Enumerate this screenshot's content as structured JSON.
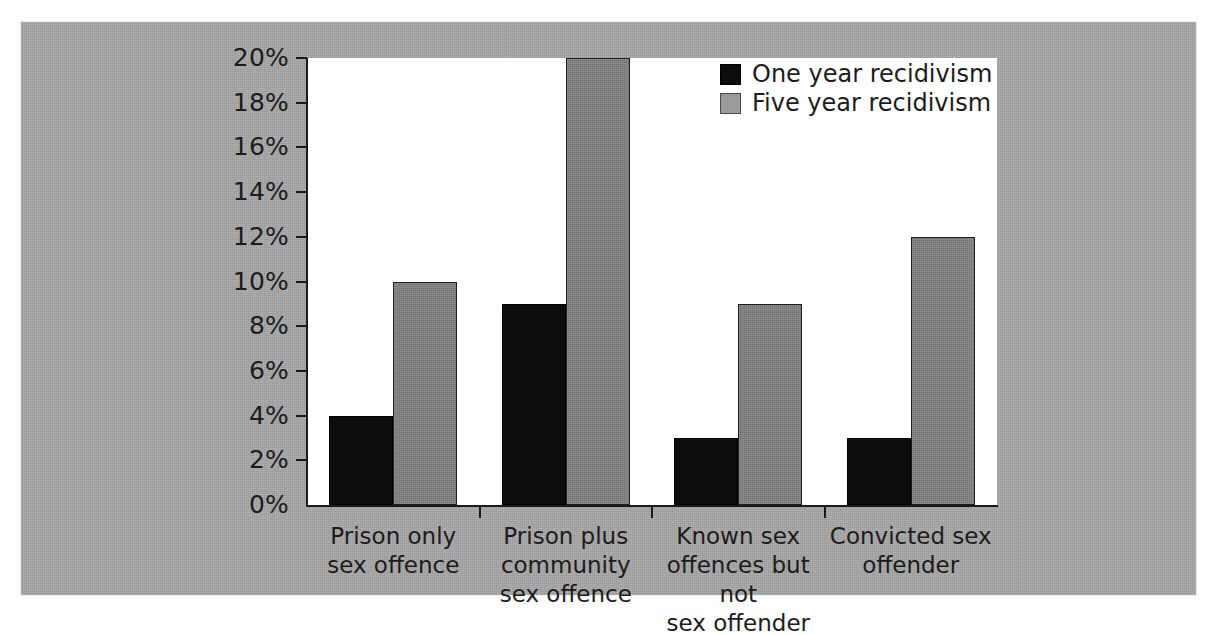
{
  "chart_data": {
    "type": "bar",
    "title": "",
    "subtitle": "",
    "xlabel": "",
    "ylabel": "",
    "ylim": [
      0,
      20
    ],
    "ytick_values": [
      0,
      2,
      4,
      6,
      8,
      10,
      12,
      14,
      16,
      18,
      20
    ],
    "ytick_labels": [
      "0%",
      "2%",
      "4%",
      "6%",
      "8%",
      "10%",
      "12%",
      "14%",
      "16%",
      "18%",
      "20%"
    ],
    "grid": false,
    "legend_position": "top-right",
    "value_suffix": "%",
    "categories": [
      "Prison only sex offence",
      "Prison plus community sex offence",
      "Known sex offences but not sex offender",
      "Convicted sex offender"
    ],
    "category_lines": [
      [
        "Prison only",
        "sex offence"
      ],
      [
        "Prison plus",
        "community",
        "sex offence"
      ],
      [
        "Known sex",
        "offences but not",
        "sex offender"
      ],
      [
        "Convicted sex",
        "offender"
      ]
    ],
    "series": [
      {
        "name": "One year recidivism",
        "color": "#0d0d0d",
        "values": [
          4,
          9,
          3,
          3
        ]
      },
      {
        "name": "Five year recidivism",
        "color": "#818181",
        "values": [
          10,
          20,
          9,
          12
        ]
      }
    ]
  },
  "legend": {
    "items": [
      {
        "label": "One year recidivism",
        "swatch": "black-square-swatch"
      },
      {
        "label": "Five year recidivism",
        "swatch": "gray-square-swatch"
      }
    ]
  }
}
